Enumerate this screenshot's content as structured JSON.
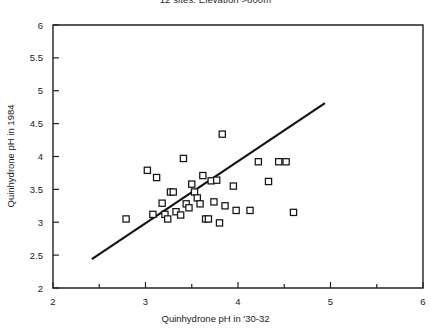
{
  "chart_data": {
    "type": "scatter",
    "title": "12 sites: Elevation >800m",
    "xlabel": "Quinhydrone pH in '30-32",
    "ylabel": "Quinhydrone pH in 1984",
    "xlim": [
      2,
      6
    ],
    "ylim": [
      2,
      6
    ],
    "xticks": [
      2,
      3,
      4,
      5,
      6
    ],
    "xtick_labels": [
      "2",
      "3",
      "4",
      "5",
      "6"
    ],
    "xminor_ticks": [
      2.5,
      3.5,
      4.5,
      5.5
    ],
    "yticks": [
      2,
      2.5,
      3,
      3.5,
      4,
      4.5,
      5,
      5.5,
      6
    ],
    "ytick_labels": [
      "2",
      "2.5",
      "3",
      "3.5",
      "4",
      "4.5",
      "5",
      "5.5",
      "6"
    ],
    "grid": false,
    "legend": null,
    "marker": "open-square",
    "points": [
      {
        "x": 2.79,
        "y": 3.05
      },
      {
        "x": 3.02,
        "y": 3.79
      },
      {
        "x": 3.08,
        "y": 3.12
      },
      {
        "x": 3.12,
        "y": 3.68
      },
      {
        "x": 3.18,
        "y": 3.29
      },
      {
        "x": 3.21,
        "y": 3.12
      },
      {
        "x": 3.24,
        "y": 3.05
      },
      {
        "x": 3.27,
        "y": 3.46
      },
      {
        "x": 3.3,
        "y": 3.46
      },
      {
        "x": 3.33,
        "y": 3.16
      },
      {
        "x": 3.38,
        "y": 3.11
      },
      {
        "x": 3.41,
        "y": 3.97
      },
      {
        "x": 3.44,
        "y": 3.28
      },
      {
        "x": 3.47,
        "y": 3.22
      },
      {
        "x": 3.5,
        "y": 3.58
      },
      {
        "x": 3.53,
        "y": 3.46
      },
      {
        "x": 3.56,
        "y": 3.37
      },
      {
        "x": 3.59,
        "y": 3.28
      },
      {
        "x": 3.62,
        "y": 3.71
      },
      {
        "x": 3.65,
        "y": 3.05
      },
      {
        "x": 3.68,
        "y": 3.05
      },
      {
        "x": 3.71,
        "y": 3.63
      },
      {
        "x": 3.74,
        "y": 3.31
      },
      {
        "x": 3.77,
        "y": 3.64
      },
      {
        "x": 3.8,
        "y": 2.99
      },
      {
        "x": 3.83,
        "y": 4.34
      },
      {
        "x": 3.86,
        "y": 3.25
      },
      {
        "x": 3.95,
        "y": 3.55
      },
      {
        "x": 3.98,
        "y": 3.18
      },
      {
        "x": 4.13,
        "y": 3.18
      },
      {
        "x": 4.22,
        "y": 3.92
      },
      {
        "x": 4.33,
        "y": 3.62
      },
      {
        "x": 4.44,
        "y": 3.92
      },
      {
        "x": 4.52,
        "y": 3.92
      },
      {
        "x": 4.6,
        "y": 3.15
      }
    ],
    "fit_line": {
      "x0": 2.42,
      "y0": 2.44,
      "x1": 4.94,
      "y1": 4.81
    }
  }
}
